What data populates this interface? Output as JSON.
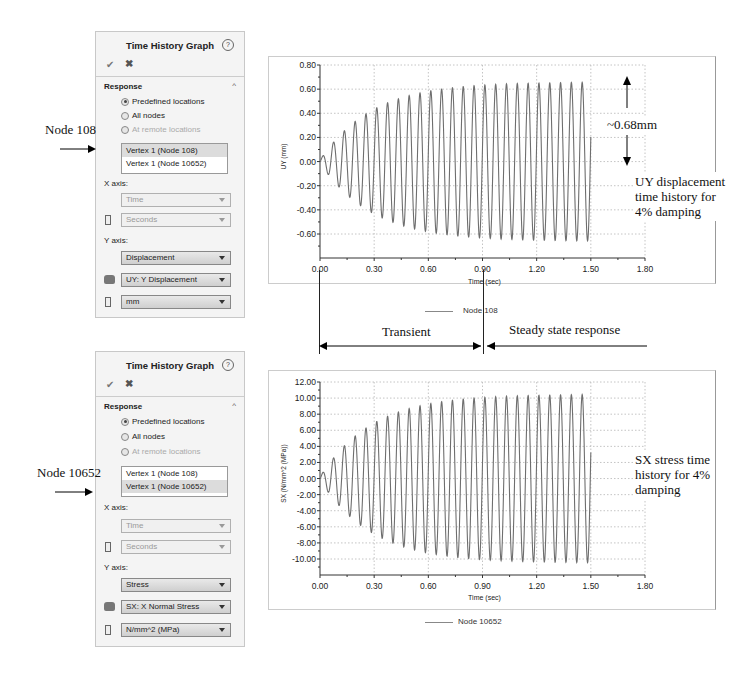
{
  "panels": [
    {
      "title": "Time History Graph",
      "help_icon": "?",
      "ok_icon": "✔",
      "cancel_icon": "✖",
      "section": "Response",
      "collapse_icon": "^",
      "radios": [
        {
          "label": "Predefined locations",
          "checked": true,
          "disabled": false
        },
        {
          "label": "All nodes",
          "checked": false,
          "disabled": false
        },
        {
          "label": "At remote locations",
          "checked": false,
          "disabled": true
        }
      ],
      "list_items": [
        "Vertex 1 (Node 108)",
        "Vertex 1 (Node 10652)"
      ],
      "selected_index": 0,
      "x_axis_label": "X axis:",
      "x_quantity": "Time",
      "x_unit": "Seconds",
      "y_axis_label": "Y axis:",
      "y_quantity": "Displacement",
      "y_component": "UY: Y Displacement",
      "y_unit": "mm"
    },
    {
      "title": "Time History Graph",
      "help_icon": "?",
      "ok_icon": "✔",
      "cancel_icon": "✖",
      "section": "Response",
      "collapse_icon": "^",
      "radios": [
        {
          "label": "Predefined locations",
          "checked": true,
          "disabled": false
        },
        {
          "label": "All nodes",
          "checked": false,
          "disabled": false
        },
        {
          "label": "At remote locations",
          "checked": false,
          "disabled": true
        }
      ],
      "list_items": [
        "Vertex 1 (Node 108)",
        "Vertex 1 (Node 10652)"
      ],
      "selected_index": 1,
      "x_axis_label": "X axis:",
      "x_quantity": "Time",
      "x_unit": "Seconds",
      "y_axis_label": "Y axis:",
      "y_quantity": "Stress",
      "y_component": "SX: X Normal Stress",
      "y_unit": "N/mm^2 (MPa)"
    }
  ],
  "annotations": {
    "node_top": "Node 108",
    "node_bottom": "Node 10652",
    "amplitude": "~0.68mm",
    "top_caption": [
      "UY displacement",
      "time history for",
      "4% damping"
    ],
    "bottom_caption": [
      "SX stress time",
      "history for 4%",
      "damping"
    ],
    "transient": "Transient",
    "steady": "Steady state response"
  },
  "chart_data": [
    {
      "type": "line",
      "title": "",
      "xlabel": "Time (sec)",
      "ylabel": "UY (mm)",
      "xlim": [
        0,
        1.8
      ],
      "ylim": [
        -0.8,
        0.8
      ],
      "x_ticks": [
        "0.00",
        "0.30",
        "0.60",
        "0.90",
        "1.20",
        "1.50",
        "1.80"
      ],
      "y_ticks": [
        "0.80",
        "0.60",
        "0.40",
        "0.20",
        "0.00",
        "-0.20",
        "-0.40",
        "-0.60"
      ],
      "grid": true,
      "legend": [
        "Node 108"
      ],
      "legend_position": "bottom",
      "series": [
        {
          "name": "Node 108",
          "description": "damped-onset harmonic response, ~16.7 Hz, 4% damping",
          "frequency_hz": 16.7,
          "steady_amplitude": 0.66,
          "time_constant": 0.28,
          "t_end": 1.5,
          "sample_peaks": [
            {
              "t": 0.02,
              "v": 0.08
            },
            {
              "t": 0.08,
              "v": 0.21
            },
            {
              "t": 0.14,
              "v": 0.31
            },
            {
              "t": 0.2,
              "v": 0.39
            },
            {
              "t": 0.26,
              "v": 0.45
            },
            {
              "t": 0.32,
              "v": 0.49
            },
            {
              "t": 0.38,
              "v": 0.54
            },
            {
              "t": 0.44,
              "v": 0.56
            },
            {
              "t": 0.5,
              "v": 0.59
            },
            {
              "t": 0.56,
              "v": 0.61
            },
            {
              "t": 0.62,
              "v": 0.62
            },
            {
              "t": 0.68,
              "v": 0.63
            },
            {
              "t": 0.9,
              "v": 0.65
            },
            {
              "t": 1.2,
              "v": 0.66
            },
            {
              "t": 1.48,
              "v": 0.66
            }
          ],
          "sample_troughs": [
            {
              "t": 0.05,
              "v": -0.13
            },
            {
              "t": 0.11,
              "v": -0.26
            },
            {
              "t": 0.17,
              "v": -0.35
            },
            {
              "t": 0.23,
              "v": -0.42
            },
            {
              "t": 0.29,
              "v": -0.47
            },
            {
              "t": 0.35,
              "v": -0.51
            },
            {
              "t": 0.41,
              "v": -0.55
            },
            {
              "t": 0.47,
              "v": -0.57
            },
            {
              "t": 0.53,
              "v": -0.6
            },
            {
              "t": 0.9,
              "v": -0.64
            },
            {
              "t": 1.2,
              "v": -0.66
            },
            {
              "t": 1.46,
              "v": -0.67
            }
          ]
        }
      ]
    },
    {
      "type": "line",
      "title": "",
      "xlabel": "Time (sec)",
      "ylabel": "SX (N/mm^2 (MPa))",
      "xlim": [
        0,
        1.8
      ],
      "ylim": [
        -12,
        12
      ],
      "x_ticks": [
        "0.00",
        "0.30",
        "0.60",
        "0.90",
        "1.20",
        "1.50",
        "1.80"
      ],
      "y_ticks": [
        "12.00",
        "10.00",
        "8.00",
        "6.00",
        "4.00",
        "2.00",
        "0.00",
        "-2.00",
        "-4.00",
        "-6.00",
        "-8.00",
        "-10.00"
      ],
      "grid": true,
      "legend": [
        "Node 10652"
      ],
      "legend_position": "bottom",
      "series": [
        {
          "name": "Node 10652",
          "description": "damped-onset harmonic stress response, ~16.7 Hz, 4% damping",
          "frequency_hz": 16.7,
          "steady_amplitude": 10.5,
          "time_constant": 0.28,
          "t_end": 1.5,
          "sample_peaks": [
            {
              "t": 0.02,
              "v": 1.3
            },
            {
              "t": 0.08,
              "v": 3.3
            },
            {
              "t": 0.14,
              "v": 5.0
            },
            {
              "t": 0.2,
              "v": 6.2
            },
            {
              "t": 0.26,
              "v": 7.3
            },
            {
              "t": 0.32,
              "v": 8.1
            },
            {
              "t": 0.38,
              "v": 8.6
            },
            {
              "t": 0.44,
              "v": 9.1
            },
            {
              "t": 0.5,
              "v": 9.5
            },
            {
              "t": 0.56,
              "v": 9.8
            },
            {
              "t": 0.62,
              "v": 10.0
            },
            {
              "t": 0.9,
              "v": 10.4
            },
            {
              "t": 1.2,
              "v": 10.6
            },
            {
              "t": 1.48,
              "v": 10.7
            }
          ],
          "sample_troughs": [
            {
              "t": 0.05,
              "v": -2.2
            },
            {
              "t": 0.11,
              "v": -4.1
            },
            {
              "t": 0.17,
              "v": -5.6
            },
            {
              "t": 0.23,
              "v": -6.8
            },
            {
              "t": 0.29,
              "v": -7.6
            },
            {
              "t": 0.35,
              "v": -8.3
            },
            {
              "t": 0.41,
              "v": -8.8
            },
            {
              "t": 0.47,
              "v": -9.3
            },
            {
              "t": 0.53,
              "v": -9.6
            },
            {
              "t": 0.59,
              "v": -9.8
            },
            {
              "t": 0.9,
              "v": -10.4
            },
            {
              "t": 1.2,
              "v": -10.5
            },
            {
              "t": 1.46,
              "v": -10.6
            }
          ]
        }
      ]
    }
  ],
  "colors": {
    "trace": "#6e6e6e",
    "grid": "#b5b5b5",
    "axis": "#333333",
    "panel_bg": "#f4f4f4"
  }
}
